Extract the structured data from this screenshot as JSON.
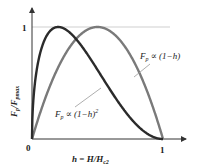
{
  "chart_data": {
    "type": "line",
    "title": "",
    "xlabel": "h = H/H_c2",
    "ylabel": "F_p/F_pmax",
    "xlim": [
      0,
      1
    ],
    "ylim": [
      0,
      1
    ],
    "x_ticks": [
      "0",
      "1"
    ],
    "y_ticks": [
      "1"
    ],
    "grid": false,
    "reference_line": {
      "y": 1,
      "color": "#cccccc"
    },
    "series": [
      {
        "name": "F_p ∝ (1−h)^2",
        "formula": "h^0.5 (1-h)^2, normalized",
        "peak_h": 0.2,
        "color": "#2b2b2b",
        "x": [
          0,
          0.05,
          0.1,
          0.2,
          0.3,
          0.4,
          0.5,
          0.6,
          0.7,
          0.8,
          0.9,
          1.0
        ],
        "values": [
          0,
          0.66,
          0.82,
          1.0,
          0.96,
          0.83,
          0.66,
          0.47,
          0.29,
          0.13,
          0.04,
          0
        ]
      },
      {
        "name": "F_p ∝ (1−h)",
        "formula": "h (1-h), normalized",
        "peak_h": 0.5,
        "color": "#7a7a7a",
        "x": [
          0,
          0.1,
          0.2,
          0.3,
          0.4,
          0.5,
          0.6,
          0.7,
          0.8,
          0.9,
          1.0
        ],
        "values": [
          0,
          0.36,
          0.64,
          0.84,
          0.96,
          1.0,
          0.96,
          0.84,
          0.64,
          0.36,
          0
        ]
      }
    ],
    "annotations": [
      {
        "text": "F_p ∝ (1−h)",
        "target_series": 1
      },
      {
        "text": "F_p ∝ (1−h)^2",
        "target_series": 0
      }
    ]
  },
  "labels": {
    "origin": "0",
    "x_one": "1",
    "y_one": "1",
    "xlabel_main": "h = H/H",
    "xlabel_sub": "c2",
    "ylabel_main": "F",
    "ylabel_sub1": "p",
    "ylabel_mid": "/F",
    "ylabel_sub2": "pmax",
    "ann1_F": "F",
    "ann1_p": "p",
    "ann1_rest": " ∝ (1−h)",
    "ann2_F": "F",
    "ann2_p": "p",
    "ann2_rest": " ∝ (1−h)",
    "ann2_sup": "2"
  }
}
